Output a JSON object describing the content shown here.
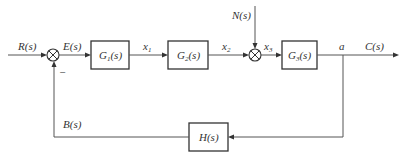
{
  "diagram": {
    "type": "control-system-block-diagram",
    "signals": {
      "input": "R(s)",
      "error": "E(s)",
      "x1": "x",
      "x1_sub": "1",
      "x2": "x",
      "x2_sub": "2",
      "x3": "x",
      "x3_sub": "3",
      "disturbance": "N(s)",
      "node": "a",
      "output": "C(s)",
      "feedback": "B(s)",
      "minus_sign": "−"
    },
    "blocks": {
      "g1": {
        "name": "G",
        "sub": "1",
        "arg": "(s)"
      },
      "g2": {
        "name": "G",
        "sub": "2",
        "arg": "(s)"
      },
      "g3": {
        "name": "G",
        "sub": "3",
        "arg": "(s)"
      },
      "h": {
        "name": "H",
        "arg": "(s)"
      }
    },
    "summing_junctions": [
      {
        "id": "sum1",
        "inputs": [
          "R(s)",
          "-B(s)"
        ],
        "output": "E(s)"
      },
      {
        "id": "sum2",
        "inputs": [
          "x2",
          "N(s)"
        ],
        "output": "x3"
      }
    ],
    "connections": [
      "R(s) -> sum1",
      "sum1 -> G1(s) [E(s)]",
      "G1(s) -> G2(s) [x1]",
      "G2(s) -> sum2 [x2]",
      "N(s) -> sum2",
      "sum2 -> G3(s) [x3]",
      "G3(s) -> a -> C(s)",
      "a -> H(s)",
      "H(s) -> sum1 [B(s), negative]"
    ]
  }
}
